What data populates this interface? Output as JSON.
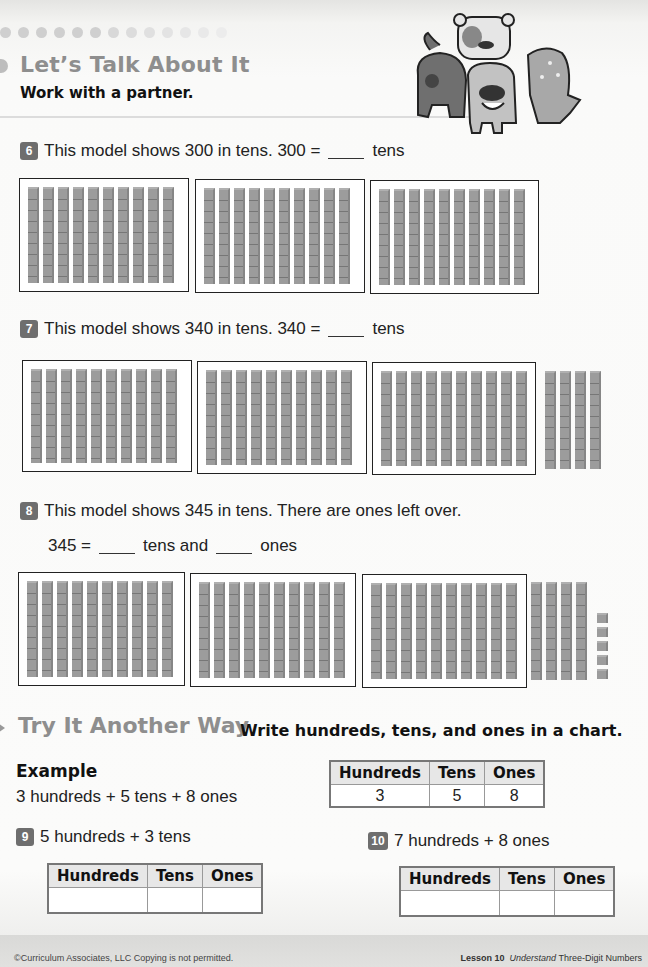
{
  "header": {
    "section_title": "Let’s Talk About It",
    "section_subtitle": "Work with a partner.",
    "illustration": "mascot-group-icon"
  },
  "questions": [
    {
      "number": "6",
      "text_before": "This model shows 300 in tens. 300 =",
      "text_after": "tens",
      "model": {
        "hundreds_boxes": 3,
        "loose_tens": 0,
        "ones": 0
      }
    },
    {
      "number": "7",
      "text_before": "This model shows 340 in tens. 340 =",
      "text_after": "tens",
      "model": {
        "hundreds_boxes": 3,
        "loose_tens": 4,
        "ones": 0
      }
    },
    {
      "number": "8",
      "text_line1": "This model shows 345 in tens. There are ones left over.",
      "text_line2_a": "345 =",
      "text_line2_b": "tens and",
      "text_line2_c": "ones",
      "model": {
        "hundreds_boxes": 3,
        "loose_tens": 4,
        "ones": 5
      }
    }
  ],
  "try_another_way": {
    "title": "Try It Another Way",
    "instruction": "Write hundreds, tens, and ones in a chart.",
    "example": {
      "label": "Example",
      "expression": "3 hundreds + 5 tens + 8 ones",
      "table": {
        "headers": [
          "Hundreds",
          "Tens",
          "Ones"
        ],
        "values": [
          "3",
          "5",
          "8"
        ]
      }
    },
    "items": [
      {
        "number": "9",
        "expression": "5 hundreds + 3 tens",
        "table": {
          "headers": [
            "Hundreds",
            "Tens",
            "Ones"
          ],
          "values": [
            "",
            "",
            ""
          ]
        }
      },
      {
        "number": "10",
        "expression": "7 hundreds + 8 ones",
        "table": {
          "headers": [
            "Hundreds",
            "Tens",
            "Ones"
          ],
          "values": [
            "",
            "",
            ""
          ]
        }
      }
    ]
  },
  "footer": {
    "copyright": "©Curriculum Associates, LLC   Copying is not permitted.",
    "lesson_label": "Lesson 10",
    "lesson_italic": "Understand",
    "lesson_title": "Three-Digit Numbers"
  }
}
